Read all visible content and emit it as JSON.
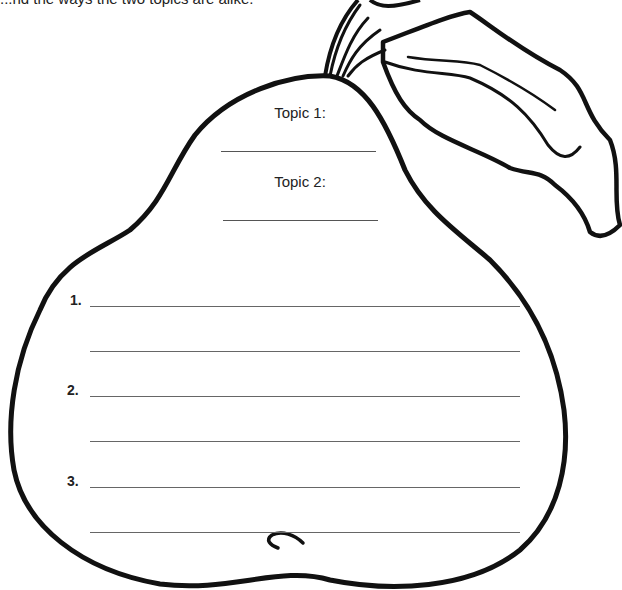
{
  "header": {
    "cut_off_text": "...nd the ways the two topics are alike."
  },
  "topics": [
    {
      "label": "Topic 1:"
    },
    {
      "label": "Topic 2:"
    }
  ],
  "items": [
    {
      "number": "1."
    },
    {
      "number": "2."
    },
    {
      "number": "3."
    }
  ],
  "illustration": {
    "shape": "pear-icon",
    "stroke_color": "#111111",
    "line_color": "#666666"
  }
}
